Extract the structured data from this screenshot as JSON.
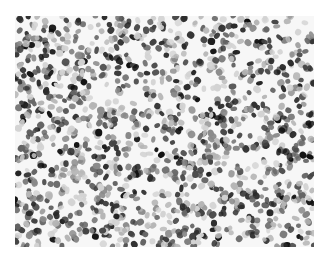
{
  "image": {
    "description": "Grayscale microscopy image of densely packed cell nuclei",
    "background": "#f7f7f7",
    "nucleus_colors": [
      "#111111",
      "#2b2b2b",
      "#444444",
      "#666666",
      "#8a8a8a",
      "#b5b5b5",
      "#d2d2d2"
    ],
    "bounds": {
      "x": 15,
      "y": 16,
      "width": 299,
      "height": 231
    },
    "nucleus_count": 1400,
    "seed": 7
  }
}
